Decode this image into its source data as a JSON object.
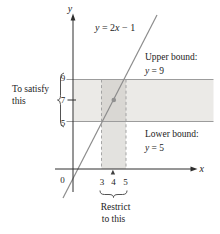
{
  "figure": {
    "axes": {
      "x_label": "x",
      "y_label": "y",
      "origin_label": "0"
    },
    "line": {
      "eq_y": "y",
      "eq_mid": " = 2",
      "eq_x": "x",
      "eq_tail": " − 1",
      "point": {
        "x": 4,
        "y": 7
      }
    },
    "upper_bound": {
      "label": "Upper bound:",
      "eq_y": "y",
      "eq_rest": " = 9"
    },
    "lower_bound": {
      "label": "Lower bound:",
      "eq_y": "y",
      "eq_rest": " = 5"
    },
    "y_ticks": [
      "9",
      "7",
      "5"
    ],
    "x_ticks": [
      "3",
      "4",
      "5"
    ],
    "annotations": {
      "left_line1": "To satisfy",
      "left_line2": "this",
      "bottom_line1": "Restrict",
      "bottom_line2": "to this"
    },
    "colors": {
      "band": "#ebeae7",
      "strip_dark": "#d9d7d3",
      "strip_light": "#e3e2df",
      "bound_line": "#9c9c9c",
      "dashed_line": "#9c9c9c",
      "function_line": "#8c8c8c",
      "dot": "#909090",
      "axis": "#2e2e2e",
      "brace": "#3f3f3f",
      "text": "#1c1c1c"
    }
  }
}
